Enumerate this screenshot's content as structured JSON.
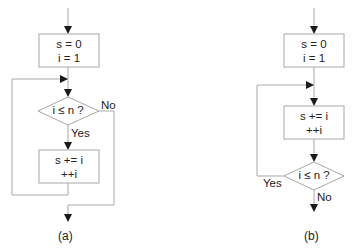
{
  "figure": {
    "a": {
      "caption": "(a)",
      "init_box": {
        "line1": "s = 0",
        "line2": "i = 1"
      },
      "condition": "i ≤ n ?",
      "yes_label": "Yes",
      "no_label": "No",
      "body_box": {
        "line1": "s += i",
        "line2": "++i"
      }
    },
    "b": {
      "caption": "(b)",
      "init_box": {
        "line1": "s = 0",
        "line2": "i = 1"
      },
      "body_box": {
        "line1": "s += i",
        "line2": "++i"
      },
      "condition": "i ≤ n ?",
      "yes_label": "Yes",
      "no_label": "No"
    }
  },
  "colors": {
    "line": "#a8a8a8",
    "arrow": "#1a1a1a",
    "text": "#222222"
  }
}
